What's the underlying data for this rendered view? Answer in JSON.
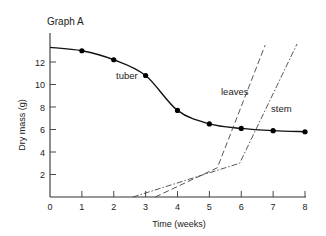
{
  "chart_data": {
    "type": "line",
    "title": "Graph A",
    "xlabel": "Time (weeks)",
    "ylabel": "Dry mass (g)",
    "xlim": [
      0,
      8
    ],
    "ylim": [
      0,
      14.5
    ],
    "xticks": [
      0,
      1,
      2,
      3,
      4,
      5,
      6,
      7,
      8
    ],
    "xtick_labels": [
      "0",
      "1",
      "2",
      "3",
      "4",
      "5",
      "6",
      "7",
      "8"
    ],
    "yticks": [
      2,
      4,
      6,
      8,
      10,
      12
    ],
    "ytick_labels": [
      "2",
      "4",
      "6",
      "8",
      "10",
      "12"
    ],
    "grid": false,
    "legend": "none",
    "series": [
      {
        "name": "tuber",
        "style": "solid",
        "markers": true,
        "curve_start": {
          "x": 0,
          "y": 13.3
        },
        "x": [
          1,
          2,
          3,
          4,
          5,
          6,
          7,
          8
        ],
        "y": [
          13.0,
          12.2,
          10.8,
          7.7,
          6.5,
          6.1,
          5.9,
          5.8
        ],
        "label": "tuber"
      },
      {
        "name": "leaves",
        "style": "dashed",
        "markers": false,
        "x": [
          3.3,
          5.25,
          6.75
        ],
        "y": [
          0,
          2.6,
          13.5
        ],
        "label": "leaves"
      },
      {
        "name": "stem",
        "style": "dash-dot",
        "markers": false,
        "x": [
          2.6,
          5.95,
          7.75
        ],
        "y": [
          0,
          3.0,
          13.6
        ],
        "label": "stem"
      }
    ]
  }
}
